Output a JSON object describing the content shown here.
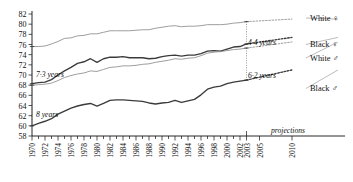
{
  "chart_data": {
    "type": "line",
    "title": "",
    "subtitle": "",
    "xlabel": "",
    "ylabel": "",
    "ylim": [
      58,
      82
    ],
    "ytick_step": 2,
    "yticks": [
      58,
      60,
      62,
      64,
      66,
      68,
      70,
      72,
      74,
      76,
      78,
      80,
      82
    ],
    "xlim": [
      1970,
      2010
    ],
    "xtick_labels": [
      "1970",
      "1972",
      "1974",
      "1976",
      "1978",
      "1980",
      "1982",
      "1984",
      "1986",
      "1988",
      "1990",
      "1992",
      "1994",
      "1996",
      "1998",
      "2000",
      "2002",
      "2003",
      "2005",
      "2010"
    ],
    "xtick_values": [
      1970,
      1972,
      1974,
      1976,
      1978,
      1980,
      1982,
      1984,
      1986,
      1988,
      1990,
      1992,
      1994,
      1996,
      1998,
      2000,
      2002,
      2003,
      2005,
      2010
    ],
    "grid": false,
    "legend_position": "right-inline",
    "projection_start_year": 2003,
    "projection_note": "projections",
    "series": [
      {
        "name": "White ♀",
        "label": "White ♀",
        "color": "#8d8d8d",
        "style": "solid",
        "x": [
          1970,
          1971,
          1972,
          1973,
          1974,
          1975,
          1976,
          1977,
          1978,
          1979,
          1980,
          1981,
          1982,
          1983,
          1984,
          1985,
          1986,
          1987,
          1988,
          1989,
          1990,
          1991,
          1992,
          1993,
          1994,
          1995,
          1996,
          1997,
          1998,
          1999,
          2000,
          2001,
          2002,
          2003
        ],
        "values": [
          75.6,
          75.6,
          75.7,
          76.1,
          76.6,
          77.2,
          77.3,
          77.7,
          77.8,
          78.1,
          78.1,
          78.4,
          78.7,
          78.7,
          78.7,
          78.7,
          78.8,
          78.9,
          78.9,
          79.2,
          79.4,
          79.6,
          79.7,
          79.5,
          79.6,
          79.6,
          79.7,
          79.9,
          79.9,
          79.9,
          80.0,
          80.2,
          80.3,
          80.5
        ],
        "projection_x": [
          2003,
          2010
        ],
        "projection_values": [
          80.5,
          81.0
        ]
      },
      {
        "name": "Black ♀",
        "label": "Black ♀",
        "color": "#3b3b3b",
        "style": "solid",
        "x": [
          1970,
          1971,
          1972,
          1973,
          1974,
          1975,
          1976,
          1977,
          1978,
          1979,
          1980,
          1981,
          1982,
          1983,
          1984,
          1985,
          1986,
          1987,
          1988,
          1989,
          1990,
          1991,
          1992,
          1993,
          1994,
          1995,
          1996,
          1997,
          1998,
          1999,
          2000,
          2001,
          2002,
          2003
        ],
        "values": [
          68.3,
          68.5,
          68.6,
          69.1,
          70.0,
          70.8,
          71.5,
          72.3,
          72.6,
          73.2,
          72.5,
          73.2,
          73.5,
          73.5,
          73.6,
          73.4,
          73.4,
          73.4,
          73.2,
          73.3,
          73.6,
          73.8,
          73.9,
          73.7,
          73.9,
          73.9,
          74.2,
          74.7,
          74.8,
          74.7,
          75.1,
          75.5,
          75.6,
          76.1
        ],
        "projection_x": [
          2003,
          2010
        ],
        "projection_values": [
          76.1,
          77.4
        ]
      },
      {
        "name": "White ♂",
        "label": "White ♂",
        "color": "#8d8d8d",
        "style": "solid",
        "x": [
          1970,
          1971,
          1972,
          1973,
          1974,
          1975,
          1976,
          1977,
          1978,
          1979,
          1980,
          1981,
          1982,
          1983,
          1984,
          1985,
          1986,
          1987,
          1988,
          1989,
          1990,
          1991,
          1992,
          1993,
          1994,
          1995,
          1996,
          1997,
          1998,
          1999,
          2000,
          2001,
          2002,
          2003
        ],
        "values": [
          68.0,
          68.1,
          68.2,
          68.4,
          68.9,
          69.5,
          69.9,
          70.2,
          70.4,
          70.8,
          70.7,
          71.1,
          71.5,
          71.6,
          71.8,
          71.8,
          71.9,
          72.1,
          72.2,
          72.5,
          72.7,
          72.9,
          73.2,
          73.1,
          73.3,
          73.4,
          73.8,
          74.3,
          74.5,
          74.6,
          74.8,
          75.0,
          75.1,
          75.3
        ],
        "projection_x": [
          2003,
          2010
        ],
        "projection_values": [
          75.3,
          76.5
        ]
      },
      {
        "name": "Black ♂",
        "label": "Black ♂",
        "color": "#3b3b3b",
        "style": "solid",
        "x": [
          1970,
          1971,
          1972,
          1973,
          1974,
          1975,
          1976,
          1977,
          1978,
          1979,
          1980,
          1981,
          1982,
          1983,
          1984,
          1985,
          1986,
          1987,
          1988,
          1989,
          1990,
          1991,
          1992,
          1993,
          1994,
          1995,
          1996,
          1997,
          1998,
          1999,
          2000,
          2001,
          2002,
          2003
        ],
        "values": [
          60.0,
          60.5,
          60.9,
          61.4,
          62.3,
          62.9,
          63.5,
          63.9,
          64.2,
          64.4,
          63.9,
          64.4,
          65.0,
          65.1,
          65.1,
          65.0,
          64.9,
          64.8,
          64.5,
          64.3,
          64.5,
          64.6,
          65.0,
          64.6,
          64.9,
          65.2,
          66.1,
          67.2,
          67.6,
          67.8,
          68.3,
          68.6,
          68.8,
          69.0
        ],
        "projection_x": [
          2003,
          2010
        ],
        "projection_values": [
          69.0,
          71.0
        ]
      }
    ],
    "gap_annotations": [
      {
        "id": "gap-1970-female",
        "label": "7·3 years",
        "year": 1970,
        "from": 68.3,
        "to": 75.6,
        "value": 7.3
      },
      {
        "id": "gap-1970-male",
        "label": "8 years",
        "year": 1970,
        "from": 60.0,
        "to": 68.0,
        "value": 8.0
      },
      {
        "id": "gap-2003-female",
        "label": "4·4 years",
        "year": 2003,
        "from": 76.1,
        "to": 80.5,
        "value": 4.4
      },
      {
        "id": "gap-2003-male",
        "label": "6·2 years",
        "year": 2003,
        "from": 69.0,
        "to": 75.3,
        "value": 6.2
      }
    ]
  }
}
